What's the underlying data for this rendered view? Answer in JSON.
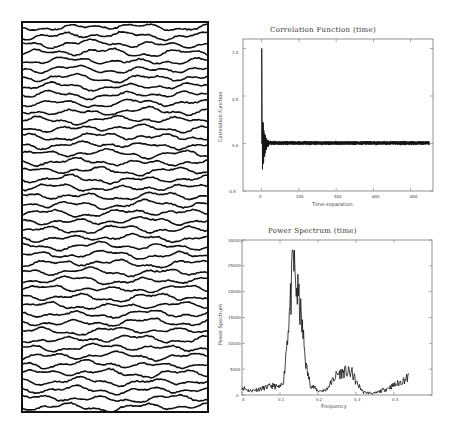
{
  "figure": {
    "left_panel": {
      "description": "seismic wiggle trace section",
      "trace_count": 46,
      "trace_color": "#111111"
    }
  },
  "chart_data": [
    {
      "type": "line",
      "title": "Correlation Function (time)",
      "xlabel": "Time-separation",
      "ylabel": "Correlation Function",
      "x_ticks": [
        "0",
        "200",
        "400",
        "600",
        "800"
      ],
      "y_ticks": [
        "-0.5",
        "0.0",
        "0.5",
        "1.0"
      ],
      "xlim": [
        -100,
        920
      ],
      "ylim": [
        -0.5,
        1.1
      ],
      "grid": false,
      "series": [
        {
          "name": "autocorrelation",
          "x": [
            0,
            2,
            5,
            10,
            15,
            20,
            30,
            40,
            60,
            80,
            100,
            200,
            300,
            400,
            500,
            600,
            700,
            800,
            900
          ],
          "values": [
            1.0,
            0.5,
            -0.35,
            0.22,
            -0.15,
            0.1,
            -0.06,
            0.04,
            0.03,
            0.02,
            0.01,
            0.01,
            0.01,
            0.01,
            0.01,
            0.01,
            0.01,
            0.01,
            0.0
          ]
        }
      ]
    },
    {
      "type": "line",
      "title": "Power Spectrum (time)",
      "xlabel": "Frequency",
      "ylabel": "Power Spectrum",
      "x_ticks": [
        "0",
        "0.1",
        "0.2",
        "0.3",
        "0.4"
      ],
      "y_ticks": [
        "0",
        "5000",
        "10000",
        "15000",
        "20000",
        "25000",
        "30000"
      ],
      "xlim": [
        0,
        0.5
      ],
      "ylim": [
        0,
        30000
      ],
      "grid": false,
      "series": [
        {
          "name": "power",
          "x": [
            0.0,
            0.02,
            0.05,
            0.08,
            0.1,
            0.11,
            0.12,
            0.13,
            0.135,
            0.14,
            0.15,
            0.16,
            0.17,
            0.18,
            0.2,
            0.22,
            0.25,
            0.27,
            0.29,
            0.3,
            0.32,
            0.35,
            0.38,
            0.41,
            0.44
          ],
          "values": [
            1500,
            800,
            1200,
            1800,
            1400,
            3000,
            12000,
            20000,
            27000,
            22000,
            18000,
            12000,
            5000,
            2000,
            800,
            900,
            4000,
            4500,
            4200,
            2500,
            500,
            300,
            1200,
            2200,
            3500
          ]
        }
      ]
    }
  ]
}
